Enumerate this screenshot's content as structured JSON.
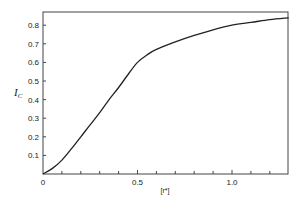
{
  "chart_data": {
    "type": "line",
    "title": "",
    "xlabel": "[r*]",
    "ylabel": "I",
    "ylabel_subscript": "C",
    "xlim": [
      0,
      1.3
    ],
    "ylim": [
      0,
      0.87
    ],
    "grid": false,
    "legend": null,
    "x_ticks": [
      {
        "value": 0,
        "label": "0"
      },
      {
        "value": 0.5,
        "label": "0.5"
      },
      {
        "value": 1.0,
        "label": "1.0"
      }
    ],
    "x_minor_ticks": [
      0.1,
      0.2,
      0.3,
      0.4,
      0.6,
      0.7,
      0.8,
      0.9,
      1.1,
      1.2
    ],
    "y_ticks": [
      {
        "value": 0.1,
        "label": "0.1"
      },
      {
        "value": 0.2,
        "label": "0.2"
      },
      {
        "value": 0.3,
        "label": "0.3"
      },
      {
        "value": 0.4,
        "label": "0.4"
      },
      {
        "value": 0.5,
        "label": "0.5"
      },
      {
        "value": 0.6,
        "label": "0.6"
      },
      {
        "value": 0.7,
        "label": "0.7"
      },
      {
        "value": 0.8,
        "label": "0.8"
      }
    ],
    "series": [
      {
        "name": "I_C",
        "x": [
          0,
          0.05,
          0.1,
          0.15,
          0.2,
          0.25,
          0.3,
          0.35,
          0.4,
          0.45,
          0.5,
          0.55,
          0.6,
          0.7,
          0.8,
          0.9,
          1.0,
          1.1,
          1.2,
          1.3
        ],
        "y": [
          0,
          0.03,
          0.075,
          0.135,
          0.2,
          0.265,
          0.33,
          0.4,
          0.465,
          0.535,
          0.6,
          0.64,
          0.67,
          0.71,
          0.745,
          0.775,
          0.8,
          0.815,
          0.83,
          0.84
        ]
      }
    ]
  }
}
